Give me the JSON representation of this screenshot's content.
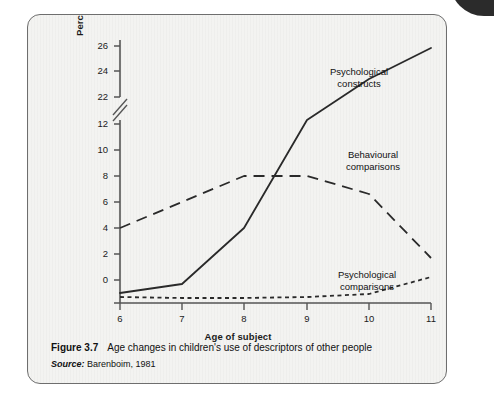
{
  "figure": {
    "number": "Figure 3.7",
    "caption": "Age changes in children's use of descriptors of other people",
    "source_label": "Source:",
    "source_text": "Barenboim, 1981"
  },
  "chart_data": {
    "type": "line",
    "title": "",
    "xlabel": "Age of subject",
    "ylabel": "Percentage of statements made",
    "x": [
      6,
      7,
      8,
      9,
      10,
      11
    ],
    "xlim": [
      6,
      11
    ],
    "xticks": [
      6,
      7,
      8,
      9,
      10,
      11
    ],
    "xtick_labels": [
      "6",
      "7",
      "8",
      "9",
      "10",
      "11"
    ],
    "yticks": [
      0,
      2,
      4,
      6,
      8,
      10,
      12,
      22,
      24,
      26
    ],
    "ytick_labels": [
      "0",
      "2",
      "4",
      "6",
      "8",
      "10",
      "12",
      "22",
      "24",
      "26"
    ],
    "y_axis_break": {
      "present": true,
      "between": [
        12,
        22
      ],
      "symbol": "double-slash"
    },
    "grid": false,
    "legend": "inline-annotations",
    "series": [
      {
        "name": "Psychological constructs",
        "style": "solid",
        "values": [
          0.8,
          1.5,
          6.0,
          12.5,
          19.0,
          25.2
        ],
        "label_x": 9.6,
        "label_y": 22.6
      },
      {
        "name": "Behavioural comparisons",
        "style": "long-dashed",
        "values": [
          6.0,
          8.0,
          10.0,
          10.0,
          8.6,
          3.7
        ],
        "label_x": 9.7,
        "label_y": 11.3
      },
      {
        "name": "Psychological comparisons",
        "style": "short-dashed",
        "values": [
          0.5,
          0.45,
          0.45,
          0.5,
          0.7,
          2.0
        ],
        "label_x": 9.6,
        "label_y": 3.0
      }
    ]
  }
}
